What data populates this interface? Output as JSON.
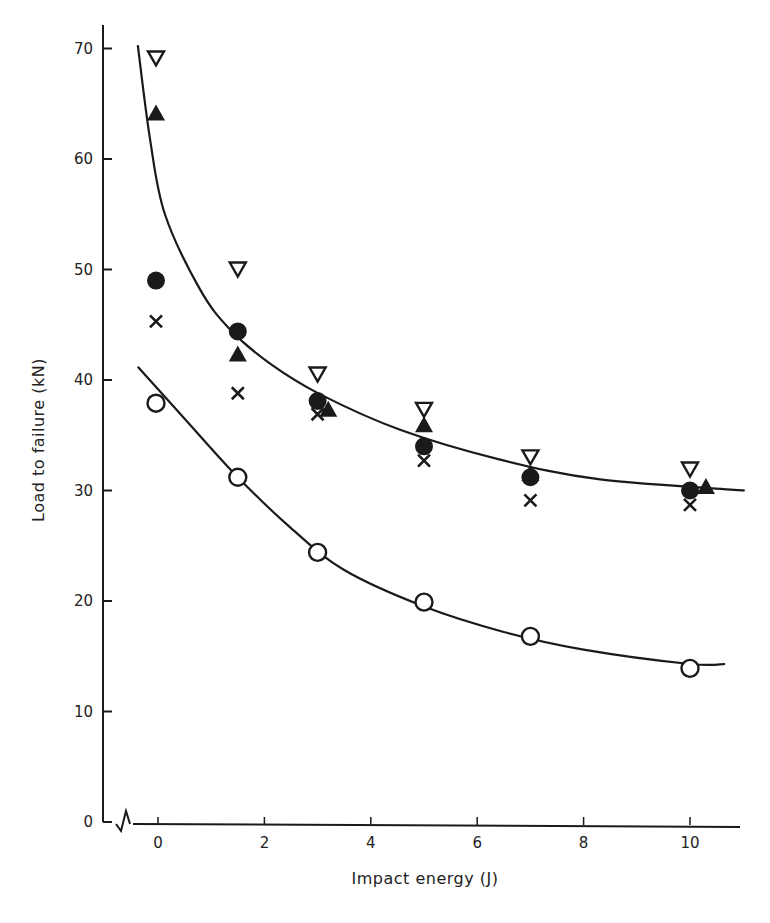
{
  "chart_data": {
    "type": "scatter",
    "title": "",
    "xlabel": "Impact energy (J)",
    "ylabel": "Load to failure (kN)",
    "xlim": [
      -0.5,
      11
    ],
    "ylim": [
      0,
      72
    ],
    "x_ticks": [
      0,
      2,
      4,
      6,
      8,
      10
    ],
    "y_ticks": [
      0,
      10,
      20,
      30,
      40,
      50,
      60,
      70
    ],
    "axis_break": "y-axis origin break symbol at x-axis start",
    "grid": false,
    "legend": "none shown",
    "series": [
      {
        "name": "open inverted triangle",
        "marker": "open-triangle-down",
        "points": [
          [
            0,
            69.1
          ],
          [
            1.5,
            50.0
          ],
          [
            3.0,
            40.5
          ],
          [
            5.0,
            37.3
          ],
          [
            7.0,
            33.0
          ],
          [
            10.0,
            31.9
          ]
        ]
      },
      {
        "name": "filled triangle",
        "marker": "filled-triangle-up",
        "points": [
          [
            0,
            64.2
          ],
          [
            1.5,
            42.4
          ],
          [
            3.2,
            37.4
          ],
          [
            5.0,
            36.0
          ],
          [
            7.0,
            31.6
          ],
          [
            10.3,
            30.4
          ]
        ]
      },
      {
        "name": "filled circle",
        "marker": "filled-circle",
        "points": [
          [
            0,
            49.0
          ],
          [
            1.5,
            44.4
          ],
          [
            3.0,
            38.1
          ],
          [
            5.0,
            34.0
          ],
          [
            7.0,
            31.2
          ],
          [
            10.0,
            30.0
          ]
        ]
      },
      {
        "name": "cross",
        "marker": "x",
        "points": [
          [
            0,
            45.3
          ],
          [
            1.5,
            38.8
          ],
          [
            3.0,
            36.9
          ],
          [
            5.0,
            32.7
          ],
          [
            7.0,
            29.1
          ],
          [
            10.0,
            28.7
          ]
        ]
      },
      {
        "name": "open circle",
        "marker": "open-circle",
        "points": [
          [
            0,
            37.9
          ],
          [
            1.5,
            31.2
          ],
          [
            3.0,
            24.4
          ],
          [
            5.0,
            19.9
          ],
          [
            7.0,
            16.8
          ],
          [
            10.0,
            13.9
          ]
        ]
      }
    ],
    "fit_curves": [
      {
        "name": "upper fitted curve",
        "points": [
          [
            -0.38,
            70.3
          ],
          [
            -0.15,
            61.8
          ],
          [
            0.13,
            55.0
          ],
          [
            0.79,
            48.2
          ],
          [
            1.35,
            44.6
          ],
          [
            2.1,
            41.5
          ],
          [
            3.05,
            38.7
          ],
          [
            4.55,
            35.5
          ],
          [
            6.43,
            32.8
          ],
          [
            8.31,
            31.0
          ],
          [
            11.03,
            30.0
          ]
        ]
      },
      {
        "name": "lower fitted curve",
        "points": [
          [
            -0.38,
            41.2
          ],
          [
            0.5,
            36.5
          ],
          [
            1.5,
            31.2
          ],
          [
            2.5,
            26.6
          ],
          [
            3.5,
            22.8
          ],
          [
            5.0,
            19.5
          ],
          [
            6.5,
            17.2
          ],
          [
            8.0,
            15.6
          ],
          [
            10.0,
            14.3
          ],
          [
            10.66,
            14.3
          ]
        ]
      }
    ]
  }
}
